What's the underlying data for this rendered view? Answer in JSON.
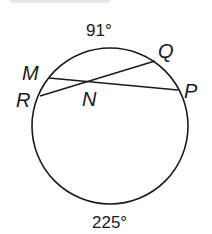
{
  "diagram": {
    "type": "circle-with-intersecting-chords",
    "circle": {
      "cx": 110,
      "cy": 126,
      "r": 77,
      "stroke": "#1a1a1a"
    },
    "points": {
      "M": {
        "label": "M",
        "x": 49,
        "y": 78
      },
      "R": {
        "label": "R",
        "x": 40,
        "y": 96
      },
      "Q": {
        "label": "Q",
        "x": 155,
        "y": 61
      },
      "P": {
        "label": "P",
        "x": 178,
        "y": 90
      },
      "N": {
        "label": "N"
      }
    },
    "chords": [
      {
        "name": "MP",
        "from": "M",
        "to": "P"
      },
      {
        "name": "RQ",
        "from": "R",
        "to": "Q"
      }
    ],
    "arcs": {
      "top": {
        "label": "91°",
        "value": 91
      },
      "bottom": {
        "label": "225°",
        "value": 225
      }
    }
  }
}
